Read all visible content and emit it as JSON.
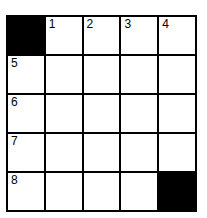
{
  "puzzle": {
    "rows": 5,
    "cols": 5,
    "cells": [
      [
        {
          "block": true
        },
        {
          "num": "1"
        },
        {
          "num": "2"
        },
        {
          "num": "3"
        },
        {
          "num": "4"
        }
      ],
      [
        {
          "num": "5"
        },
        {},
        {},
        {},
        {}
      ],
      [
        {
          "num": "6"
        },
        {},
        {},
        {},
        {}
      ],
      [
        {
          "num": "7"
        },
        {},
        {},
        {},
        {}
      ],
      [
        {
          "num": "8"
        },
        {},
        {},
        {},
        {
          "block": true
        }
      ]
    ]
  }
}
